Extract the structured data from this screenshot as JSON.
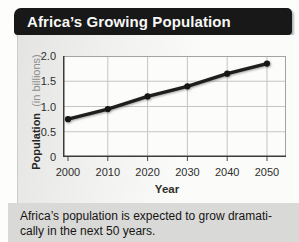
{
  "chart_data": {
    "type": "line",
    "title": "Africa’s Growing Population",
    "x": [
      2000,
      2010,
      2020,
      2030,
      2040,
      2050
    ],
    "values": [
      0.75,
      0.95,
      1.2,
      1.4,
      1.65,
      1.85
    ],
    "series_name": "Population",
    "xlabel": "Year",
    "ylabel": "Population (in billions)",
    "ylabel_bold": "Population",
    "ylabel_light": "(in billions)",
    "ylim": [
      0,
      2.0
    ],
    "yticks": [
      {
        "value": 2.0,
        "label": "2.0"
      },
      {
        "value": 1.5,
        "label": "1.5"
      },
      {
        "value": 1.0,
        "label": "1.0"
      },
      {
        "value": 0.5,
        "label": "0.5"
      },
      {
        "value": 0,
        "label": "0"
      }
    ],
    "grid": true,
    "legend": "none",
    "line_color": "#1e1e1c",
    "marker_color": "#161614"
  },
  "colors": {
    "banner_bg": "#181818",
    "banner_text": "#f7f7f5",
    "caption_bg": "#d9d9d7"
  },
  "caption": {
    "line1": "Africa’s population is expected to grow dramati-",
    "line2": "cally in the next 50 years."
  }
}
